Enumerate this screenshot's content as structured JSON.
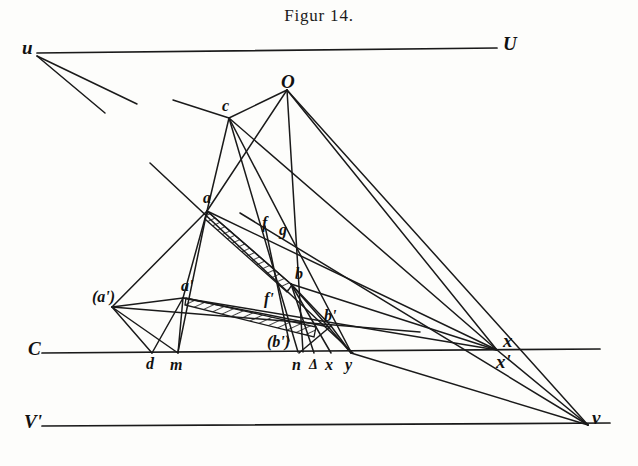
{
  "figure": {
    "title": "Figur 14.",
    "width": 638,
    "height": 466,
    "ink_color": "#1a1a1a",
    "paper_color": "#fdfdfb"
  },
  "chart_data": {
    "type": "diagram",
    "title": "Figur 14.",
    "points": [
      {
        "id": "u",
        "label": "u",
        "x": 37,
        "y": 53,
        "label_x": 22,
        "label_y": 38,
        "size": "lg"
      },
      {
        "id": "U",
        "label": "U",
        "x": 497,
        "y": 48,
        "label_x": 503,
        "label_y": 34,
        "size": "lg"
      },
      {
        "id": "O",
        "label": "O",
        "x": 287,
        "y": 88,
        "label_x": 281,
        "label_y": 72,
        "size": "lg"
      },
      {
        "id": "c",
        "label": "c",
        "x": 229,
        "y": 117,
        "label_x": 222,
        "label_y": 98,
        "size": "md"
      },
      {
        "id": "a",
        "label": "a",
        "x": 207,
        "y": 210,
        "label_x": 203,
        "label_y": 190,
        "size": "md"
      },
      {
        "id": "f",
        "label": "f",
        "x": 268,
        "y": 230,
        "label_x": 262,
        "label_y": 215,
        "size": "md"
      },
      {
        "id": "g",
        "label": "g",
        "x": 285,
        "y": 236,
        "label_x": 279,
        "label_y": 222,
        "size": "md"
      },
      {
        "id": "b",
        "label": "b",
        "x": 289,
        "y": 282,
        "label_x": 295,
        "label_y": 266,
        "size": "md"
      },
      {
        "id": "aprime",
        "label": "a'",
        "x": 183,
        "y": 297,
        "label_x": 181,
        "label_y": 278,
        "size": "md"
      },
      {
        "id": "aparen",
        "label": "(a')",
        "x": 112,
        "y": 306,
        "label_x": 92,
        "label_y": 289,
        "size": "md"
      },
      {
        "id": "fprime",
        "label": "f'",
        "x": 272,
        "y": 307,
        "label_x": 264,
        "label_y": 291,
        "size": "md"
      },
      {
        "id": "bprime",
        "label": "b'",
        "x": 325,
        "y": 323,
        "label_x": 324,
        "label_y": 308,
        "size": "md"
      },
      {
        "id": "bparen",
        "label": "(b')",
        "x": 288,
        "y": 338,
        "label_x": 267,
        "label_y": 334,
        "size": "md"
      },
      {
        "id": "d",
        "label": "d",
        "x": 152,
        "y": 352,
        "label_x": 146,
        "label_y": 356,
        "size": "md"
      },
      {
        "id": "m",
        "label": "m",
        "x": 178,
        "y": 352,
        "label_x": 170,
        "label_y": 357,
        "size": "md"
      },
      {
        "id": "n",
        "label": "n",
        "x": 298,
        "y": 352,
        "label_x": 292,
        "label_y": 357,
        "size": "md"
      },
      {
        "id": "delta",
        "label": "Δ",
        "x": 314,
        "y": 352,
        "label_x": 309,
        "label_y": 358,
        "size": "sm"
      },
      {
        "id": "xlow",
        "label": "x",
        "x": 331,
        "y": 352,
        "label_x": 325,
        "label_y": 357,
        "size": "md"
      },
      {
        "id": "y",
        "label": "y",
        "x": 351,
        "y": 352,
        "label_x": 345,
        "label_y": 357,
        "size": "md"
      },
      {
        "id": "xvp",
        "label": "x",
        "x": 497,
        "y": 350,
        "label_x": 503,
        "label_y": 331,
        "size": "lg"
      },
      {
        "id": "xpvp",
        "label": "x'",
        "x": 497,
        "y": 350,
        "label_x": 496,
        "label_y": 352,
        "size": "lg"
      },
      {
        "id": "C",
        "label": "C",
        "x": 42,
        "y": 352,
        "label_x": 28,
        "label_y": 339,
        "size": "lg"
      },
      {
        "id": "Vp",
        "label": "V'",
        "x": 42,
        "y": 425,
        "label_x": 24,
        "label_y": 412,
        "size": "lg"
      },
      {
        "id": "v",
        "label": "v",
        "x": 588,
        "y": 425,
        "label_x": 592,
        "label_y": 408,
        "size": "lg"
      }
    ],
    "horizontal_lines": [
      {
        "name": "u-U-line",
        "x1": 37,
        "y1": 53,
        "x2": 497,
        "y2": 48
      },
      {
        "name": "C-line",
        "x1": 42,
        "y1": 353,
        "x2": 600,
        "y2": 349
      },
      {
        "name": "V-prime-line",
        "x1": 42,
        "y1": 426,
        "x2": 610,
        "y2": 423
      }
    ],
    "segments": [
      {
        "from": "u",
        "to": "free1",
        "x1": 37,
        "y1": 56,
        "x2": 137,
        "y2": 104
      },
      {
        "from": "u",
        "to": "free2",
        "x1": 37,
        "y1": 56,
        "x2": 105,
        "y2": 113
      },
      {
        "from": "c-upleft",
        "to": "c",
        "x1": 173,
        "y1": 100,
        "x2": 229,
        "y2": 118
      },
      {
        "from": "c",
        "to": "O",
        "x1": 229,
        "y1": 118,
        "x2": 287,
        "y2": 90
      },
      {
        "from": "O",
        "to": "bprime-low",
        "x1": 287,
        "y1": 90,
        "x2": 303,
        "y2": 352
      },
      {
        "from": "O",
        "to": "a",
        "x1": 287,
        "y1": 90,
        "x2": 207,
        "y2": 211
      },
      {
        "from": "c",
        "to": "a",
        "x1": 229,
        "y1": 118,
        "x2": 207,
        "y2": 211
      },
      {
        "from": "c",
        "to": "n",
        "x1": 229,
        "y1": 118,
        "x2": 298,
        "y2": 352
      },
      {
        "from": "c",
        "to": "y",
        "x1": 229,
        "y1": 118,
        "x2": 351,
        "y2": 352
      },
      {
        "from": "c",
        "to": "xvp",
        "x1": 229,
        "y1": 118,
        "x2": 497,
        "y2": 350
      },
      {
        "from": "O",
        "to": "v",
        "x1": 287,
        "y1": 90,
        "x2": 588,
        "y2": 425
      },
      {
        "from": "O",
        "to": "xvp",
        "x1": 287,
        "y1": 90,
        "x2": 497,
        "y2": 350
      },
      {
        "from": "a",
        "to": "b",
        "x1": 207,
        "y1": 211,
        "x2": 291,
        "y2": 284
      },
      {
        "from": "a",
        "to": "xvp",
        "x1": 207,
        "y1": 211,
        "x2": 497,
        "y2": 350
      },
      {
        "from": "a",
        "to": "aparen",
        "x1": 207,
        "y1": 211,
        "x2": 112,
        "y2": 307
      },
      {
        "from": "a",
        "to": "m",
        "x1": 207,
        "y1": 211,
        "x2": 178,
        "y2": 352
      },
      {
        "from": "a",
        "to": "aprime",
        "x1": 207,
        "y1": 211,
        "x2": 183,
        "y2": 298
      },
      {
        "from": "u-long",
        "to": "y",
        "x1": 150,
        "y1": 163,
        "x2": 353,
        "y2": 353
      },
      {
        "from": "aparen",
        "to": "aprime",
        "x1": 112,
        "y1": 307,
        "x2": 183,
        "y2": 298
      },
      {
        "from": "aparen",
        "to": "bprime-ray",
        "x1": 112,
        "y1": 307,
        "x2": 420,
        "y2": 332
      },
      {
        "from": "aparen",
        "to": "d",
        "x1": 112,
        "y1": 307,
        "x2": 152,
        "y2": 353
      },
      {
        "from": "aparen",
        "to": "m",
        "x1": 112,
        "y1": 307,
        "x2": 178,
        "y2": 353
      },
      {
        "from": "aprime",
        "to": "d",
        "x1": 183,
        "y1": 298,
        "x2": 152,
        "y2": 353
      },
      {
        "from": "aprime",
        "to": "m",
        "x1": 183,
        "y1": 298,
        "x2": 178,
        "y2": 353
      },
      {
        "from": "aprime",
        "to": "bprime",
        "x1": 183,
        "y1": 298,
        "x2": 329,
        "y2": 327
      },
      {
        "from": "aprime",
        "to": "xvp",
        "x1": 183,
        "y1": 298,
        "x2": 497,
        "y2": 350
      },
      {
        "from": "b",
        "to": "xvp",
        "x1": 291,
        "y1": 284,
        "x2": 497,
        "y2": 350
      },
      {
        "from": "b",
        "to": "y",
        "x1": 291,
        "y1": 284,
        "x2": 351,
        "y2": 353
      },
      {
        "from": "b",
        "to": "delta",
        "x1": 291,
        "y1": 284,
        "x2": 314,
        "y2": 353
      },
      {
        "from": "b",
        "to": "xlow",
        "x1": 291,
        "y1": 284,
        "x2": 331,
        "y2": 353
      },
      {
        "from": "b",
        "to": "bprime",
        "x1": 291,
        "y1": 284,
        "x2": 331,
        "y2": 326
      },
      {
        "from": "f",
        "to": "bparen",
        "x1": 265,
        "y1": 226,
        "x2": 289,
        "y2": 341
      },
      {
        "from": "bprime",
        "to": "y",
        "x1": 331,
        "y1": 326,
        "x2": 351,
        "y2": 353
      },
      {
        "from": "bprime",
        "to": "n",
        "x1": 331,
        "y1": 326,
        "x2": 299,
        "y2": 353
      },
      {
        "from": "g",
        "to": "v",
        "x1": 240,
        "y1": 213,
        "x2": 588,
        "y2": 425
      },
      {
        "from": "y",
        "to": "v",
        "x1": 351,
        "y1": 353,
        "x2": 588,
        "y2": 425
      },
      {
        "from": "xvp",
        "to": "v",
        "x1": 497,
        "y1": 350,
        "x2": 588,
        "y2": 425
      }
    ],
    "hatched_regions": [
      {
        "name": "upper-sliver",
        "path": "M 208 212 L 292 285 L 287 292 L 205 219 Z"
      },
      {
        "name": "lower-sliver",
        "path": "M 186 298 L 316 327 L 314 337 L 185 305 Z"
      }
    ]
  }
}
